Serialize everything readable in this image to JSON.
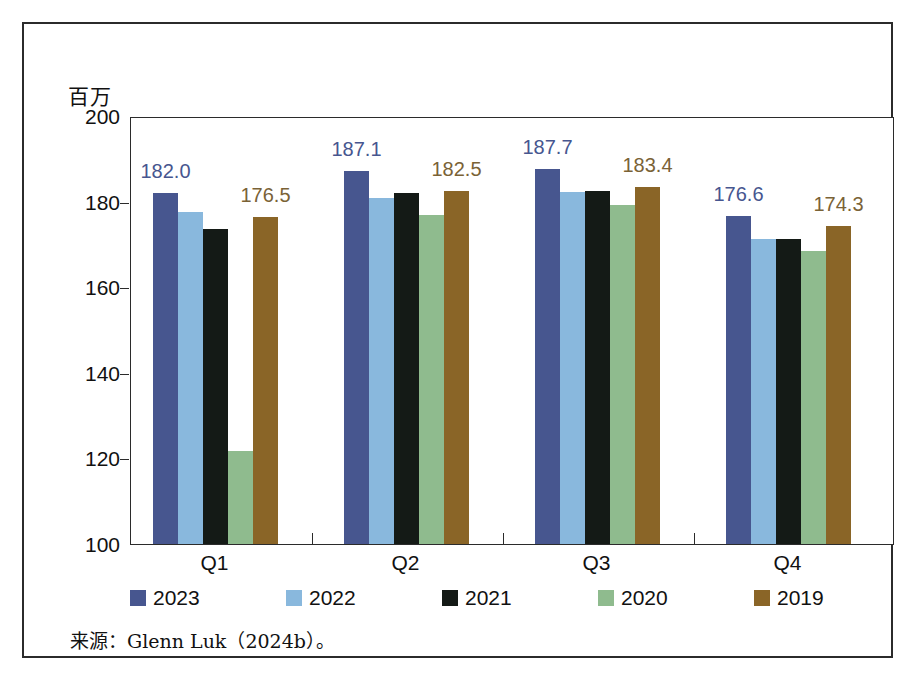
{
  "unit_label": "百万",
  "source_note": "来源：Glenn Luk（2024b）。",
  "axis": {
    "y_ticks": [
      "200",
      "180",
      "160",
      "140",
      "120",
      "100"
    ],
    "x_ticks": [
      "Q1",
      "Q2",
      "Q3",
      "Q4"
    ]
  },
  "legend": {
    "items": [
      {
        "label": "2023",
        "color": "#47568f"
      },
      {
        "label": "2022",
        "color": "#89b8dd"
      },
      {
        "label": "2021",
        "color": "#141a16"
      },
      {
        "label": "2020",
        "color": "#8fbb8e"
      },
      {
        "label": "2019",
        "color": "#8a6527"
      }
    ]
  },
  "chart_data": {
    "type": "bar",
    "title": "",
    "xlabel": "",
    "ylabel": "百万",
    "ylim": [
      100,
      200
    ],
    "ytick_values": [
      100,
      120,
      140,
      160,
      180,
      200
    ],
    "grid": false,
    "legend_position": "bottom",
    "categories": [
      "Q1",
      "Q2",
      "Q3",
      "Q4"
    ],
    "series": [
      {
        "name": "2023",
        "color": "#47568f",
        "values": [
          182.0,
          187.1,
          187.7,
          176.6
        ]
      },
      {
        "name": "2022",
        "color": "#89b8dd",
        "values": [
          177.5,
          180.8,
          182.2,
          171.2
        ]
      },
      {
        "name": "2021",
        "color": "#141a16",
        "values": [
          173.6,
          182.1,
          182.5,
          171.3
        ]
      },
      {
        "name": "2020",
        "color": "#8fbb8e",
        "values": [
          121.8,
          176.8,
          179.2,
          168.5
        ]
      },
      {
        "name": "2019",
        "color": "#8a6527",
        "values": [
          176.5,
          182.5,
          183.4,
          174.3
        ]
      }
    ],
    "data_labels": [
      {
        "category": "Q1",
        "series": "2023",
        "text": "182.0",
        "color": "#47568f"
      },
      {
        "category": "Q1",
        "series": "2019",
        "text": "176.5",
        "color": "#7a6236"
      },
      {
        "category": "Q2",
        "series": "2023",
        "text": "187.1",
        "color": "#47568f"
      },
      {
        "category": "Q2",
        "series": "2019",
        "text": "182.5",
        "color": "#7a6236"
      },
      {
        "category": "Q3",
        "series": "2023",
        "text": "187.7",
        "color": "#47568f"
      },
      {
        "category": "Q3",
        "series": "2019",
        "text": "183.4",
        "color": "#7a6236"
      },
      {
        "category": "Q4",
        "series": "2023",
        "text": "176.6",
        "color": "#47568f"
      },
      {
        "category": "Q4",
        "series": "2019",
        "text": "174.3",
        "color": "#7a6236"
      }
    ]
  }
}
